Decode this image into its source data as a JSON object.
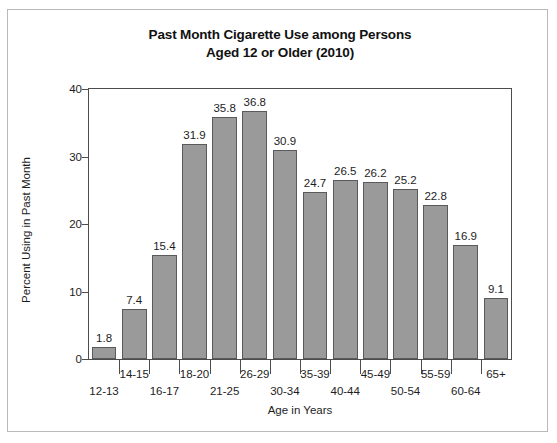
{
  "chart_data": {
    "type": "bar",
    "title_line1": "Past Month Cigarette Use among Persons",
    "title_line2": "Aged 12 or Older (2010)",
    "xlabel": "Age in Years",
    "ylabel": "Percent Using in Past Month",
    "categories": [
      "12-13",
      "14-15",
      "16-17",
      "18-20",
      "21-25",
      "26-29",
      "30-34",
      "35-39",
      "40-44",
      "45-49",
      "50-54",
      "55-59",
      "60-64",
      "65+"
    ],
    "values": [
      1.8,
      7.4,
      15.4,
      31.9,
      35.8,
      36.8,
      30.9,
      24.7,
      26.5,
      26.2,
      25.2,
      22.8,
      16.9,
      9.1
    ],
    "value_labels": [
      "1.8",
      "7.4",
      "15.4",
      "31.9",
      "35.8",
      "36.8",
      "30.9",
      "24.7",
      "26.5",
      "26.2",
      "25.2",
      "22.8",
      "16.9",
      "9.1"
    ],
    "ylim": [
      0,
      40
    ],
    "yticks": [
      0,
      10,
      20,
      30,
      40
    ],
    "ytick_labels": [
      "0",
      "10",
      "20",
      "30",
      "40"
    ],
    "grid": false,
    "legend": "none",
    "bar_color": "#9a9a9a",
    "bar_edge_color": "#5a5a5a",
    "axis_color": "#4d4d4d",
    "text_color": "#1d1d1d",
    "background": "#ffffff"
  }
}
